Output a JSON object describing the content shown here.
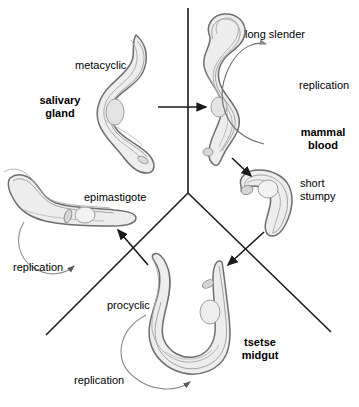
{
  "figure": {
    "kind": "trypanosome-life-cycle-diagram",
    "background_color": "#ffffff",
    "divider_color": "#1a1a1a",
    "cell_outline_color": "#6b6b6b",
    "cell_fill_color": "#ececed",
    "organelle_color": "#b9b9ba"
  },
  "compartments": [
    {
      "id": "salivary-gland",
      "label": "salivary\ngland"
    },
    {
      "id": "mammal-blood",
      "label": "mammal\nblood"
    },
    {
      "id": "tsetse-midgut",
      "label": "tsetse\nmidgut"
    }
  ],
  "stages": [
    {
      "id": "metacyclic",
      "label": "metacyclic"
    },
    {
      "id": "long-slender",
      "label": "long slender"
    },
    {
      "id": "short-stumpy",
      "label": "short\nstumpy"
    },
    {
      "id": "epimastigote",
      "label": "epimastigote"
    },
    {
      "id": "procyclic",
      "label": "procyclic"
    }
  ],
  "processes": [
    {
      "id": "replication-blood",
      "label": "replication"
    },
    {
      "id": "replication-epimastigote",
      "label": "replication"
    },
    {
      "id": "replication-procyclic",
      "label": "replication"
    }
  ],
  "labels": {
    "salivary_gland": "salivary\ngland",
    "metacyclic": "metacyclic",
    "long_slender": "long slender",
    "replication_blood": "replication",
    "mammal_blood": "mammal\nblood",
    "short_stumpy": "short\nstumpy",
    "epimastigote": "epimastigote",
    "replication_epimastigote": "replication",
    "procyclic": "procyclic",
    "tsetse_midgut": "tsetse\nmidgut",
    "replication_procyclic": "replication"
  }
}
